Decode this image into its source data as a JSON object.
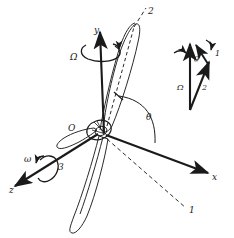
{
  "figure": {
    "background_color": "#ffffff",
    "ink_color": "#1a1a1a"
  },
  "axes": [
    {
      "id": "y",
      "label": "y",
      "description": "vertical spin axis pointing up"
    },
    {
      "id": "x",
      "label": "x",
      "description": "axis pointing down-right"
    },
    {
      "id": "z",
      "label": "z",
      "description": "axis pointing down-left"
    }
  ],
  "origin": {
    "label": "O"
  },
  "body_axes": [
    {
      "id": "1",
      "label": "1",
      "description": "dashed body axis toward lower right"
    },
    {
      "id": "2",
      "label": "2",
      "description": "dashed body axis along blade toward upper right"
    },
    {
      "id": "3",
      "label": "3",
      "description": "body axis along the z direction toward lower left"
    }
  ],
  "angular_velocities": [
    {
      "symbol": "Ω",
      "axis": "y",
      "description": "spin rate about the vertical y axis"
    },
    {
      "symbol": "ω",
      "axis": "z",
      "description": "rotation rate about the z / 3 axis"
    }
  ],
  "angles": [
    {
      "symbol": "θ",
      "location": "main",
      "description": "angle from the x axis to the blade / 2 axis"
    },
    {
      "symbol": "θ",
      "location": "inset",
      "description": "angle at apex of the vector triangle"
    }
  ],
  "inset": {
    "description": "vector triangle showing resultant angular velocity",
    "vectors": [
      {
        "symbol": "Ω",
        "description": "vertical vector, upward"
      },
      {
        "symbol": "1",
        "description": "short vector at apex, tilted right"
      },
      {
        "symbol": "2",
        "description": "slanted vector from lower vertex to upper right"
      }
    ],
    "angle_symbol": "θ"
  },
  "blades": [
    {
      "id": "upper",
      "description": "blade pointing up and to the right with dashed chord line"
    },
    {
      "id": "lower",
      "description": "long narrow blade pointing down"
    },
    {
      "id": "left",
      "description": "blade foreshortened toward the left"
    }
  ],
  "hub": {
    "description": "small ellipse at the origin where the blades meet"
  }
}
